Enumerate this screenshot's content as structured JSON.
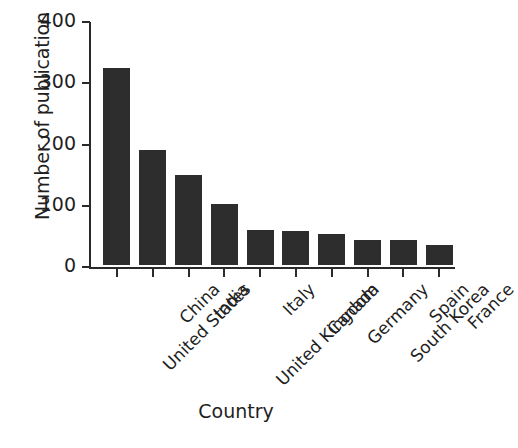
{
  "chart_data": {
    "type": "bar",
    "title": "",
    "xlabel": "Country",
    "ylabel": "Number of publication",
    "categories": [
      "United States",
      "China",
      "India",
      "United Kingdom",
      "Italy",
      "Canada",
      "Germany",
      "South Korea",
      "Spain",
      "France"
    ],
    "values": [
      322,
      188,
      147,
      99,
      57,
      55,
      51,
      41,
      41,
      32
    ],
    "ylim": [
      0,
      400
    ],
    "yticks": [
      0,
      100,
      200,
      300,
      400
    ],
    "ytick_labels": [
      "0",
      "100",
      "200",
      "300",
      "400"
    ],
    "grid": false,
    "legend": "none",
    "bar_color": "#2d2d2d",
    "axis_color": "#2a2a2a",
    "background_color": "#ffffff"
  },
  "axes": {
    "y_title": "Number of publication",
    "x_title": "Country"
  }
}
